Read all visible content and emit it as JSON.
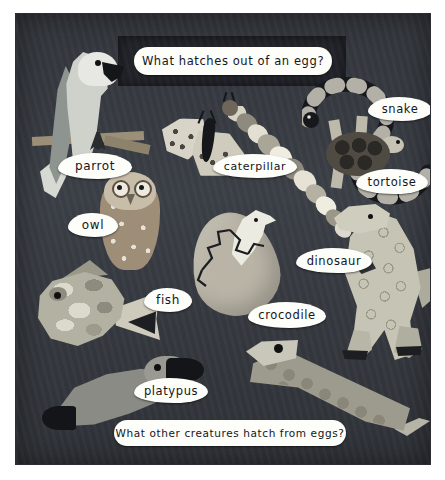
{
  "display": {
    "type": "classroom-display-board",
    "board_color": "#3b3f46",
    "label_color": "#fdfdfa",
    "title_panel_color": "#22242a"
  },
  "title": {
    "text": "What hatches out of an egg?"
  },
  "footer": {
    "text": "What other creatures hatch from eggs?"
  },
  "labels": [
    {
      "id": "parrot",
      "text": "parrot"
    },
    {
      "id": "owl",
      "text": "owl"
    },
    {
      "id": "caterpillar",
      "text": "caterpillar"
    },
    {
      "id": "snake",
      "text": "snake"
    },
    {
      "id": "tortoise",
      "text": "tortoise"
    },
    {
      "id": "dinosaur",
      "text": "dinosaur"
    },
    {
      "id": "fish",
      "text": "fish"
    },
    {
      "id": "crocodile",
      "text": "crocodile"
    },
    {
      "id": "platypus",
      "text": "platypus"
    }
  ],
  "artwork": {
    "items": [
      "parrot-collage",
      "owl-collage",
      "moth-collage",
      "caterpillar-collage",
      "snake-collage",
      "tortoise-collage",
      "hatching-egg-collage",
      "fish-collage",
      "dinosaur-collage",
      "platypus-collage",
      "crocodile-collage"
    ]
  }
}
